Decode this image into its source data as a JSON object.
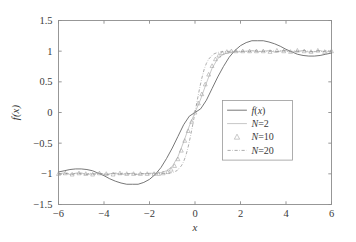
{
  "chart_data": {
    "type": "line",
    "title": "",
    "xlabel": "x",
    "ylabel": "f(x)",
    "xlim": [
      -6,
      6
    ],
    "ylim": [
      -1.5,
      1.5
    ],
    "xticks": [
      -6,
      -4,
      -2,
      0,
      2,
      4,
      6
    ],
    "xtick_labels": [
      "−6",
      "−4",
      "−2",
      "0",
      "2",
      "4",
      "6"
    ],
    "yticks": [
      -1.5,
      -1,
      -0.5,
      0,
      0.5,
      1,
      1.5
    ],
    "ytick_labels": [
      "−1.5",
      "−1",
      "−0.5",
      "0",
      "0.5",
      "1",
      "1.5"
    ],
    "grid": false,
    "legend_position": "center-right",
    "legend_entries": [
      {
        "label": "f(x)",
        "style": "solid",
        "marker": "none",
        "color": "#5e5e5e"
      },
      {
        "label": "N=2",
        "style": "solid-thin",
        "marker": "none",
        "color": "#b4b4b4"
      },
      {
        "label": "N=10",
        "style": "none",
        "marker": "triangle",
        "color": "#9c9c9c"
      },
      {
        "label": "N=20",
        "style": "dash-dot",
        "marker": "none",
        "color": "#8a8a8a"
      }
    ],
    "series": [
      {
        "name": "f(x)",
        "render": "line",
        "comment": "N=2 style smooth truncated series: large ripple, overshoot ~1.17 at x~2.5",
        "x": [
          -6.0,
          -5.75,
          -5.5,
          -5.25,
          -5.0,
          -4.75,
          -4.5,
          -4.25,
          -4.0,
          -3.75,
          -3.5,
          -3.25,
          -3.0,
          -2.75,
          -2.5,
          -2.25,
          -2.0,
          -1.75,
          -1.5,
          -1.25,
          -1.0,
          -0.75,
          -0.5,
          -0.25,
          0.0,
          0.25,
          0.5,
          0.75,
          1.0,
          1.25,
          1.5,
          1.75,
          2.0,
          2.25,
          2.5,
          2.75,
          3.0,
          3.25,
          3.5,
          3.75,
          4.0,
          4.25,
          4.5,
          4.75,
          5.0,
          5.25,
          5.5,
          5.75,
          6.0
        ],
        "y": [
          -0.97,
          -0.95,
          -0.93,
          -0.92,
          -0.92,
          -0.93,
          -0.95,
          -0.99,
          -1.03,
          -1.08,
          -1.12,
          -1.15,
          -1.17,
          -1.17,
          -1.17,
          -1.14,
          -1.09,
          -1.01,
          -0.9,
          -0.75,
          -0.58,
          -0.39,
          -0.2,
          -0.06,
          0.0,
          0.06,
          0.2,
          0.39,
          0.58,
          0.75,
          0.9,
          1.01,
          1.09,
          1.14,
          1.17,
          1.17,
          1.17,
          1.15,
          1.12,
          1.08,
          1.03,
          0.99,
          0.95,
          0.93,
          0.92,
          0.92,
          0.93,
          0.95,
          0.97
        ]
      },
      {
        "name": "N=2",
        "render": "line",
        "comment": "sharper transition, smaller amplitude ripple band near +-1",
        "x": [
          -6.0,
          -5.75,
          -5.5,
          -5.25,
          -5.0,
          -4.75,
          -4.5,
          -4.25,
          -4.0,
          -3.75,
          -3.5,
          -3.25,
          -3.0,
          -2.75,
          -2.5,
          -2.25,
          -2.0,
          -1.75,
          -1.5,
          -1.25,
          -1.0,
          -0.75,
          -0.5,
          -0.25,
          0.0,
          0.25,
          0.5,
          0.75,
          1.0,
          1.25,
          1.5,
          1.75,
          2.0,
          2.25,
          2.5,
          2.75,
          3.0,
          3.25,
          3.5,
          3.75,
          4.0,
          4.25,
          4.5,
          4.75,
          5.0,
          5.25,
          5.5,
          5.75,
          6.0
        ],
        "y": [
          -1.0,
          -0.985,
          -1.01,
          -0.99,
          -0.985,
          -1.01,
          -1.0,
          -0.985,
          -1.01,
          -1.0,
          -0.985,
          -1.01,
          -1.0,
          -0.99,
          -1.01,
          -1.0,
          -0.99,
          -0.99,
          -0.98,
          -0.95,
          -0.88,
          -0.72,
          -0.48,
          -0.22,
          0.0,
          0.22,
          0.48,
          0.72,
          0.88,
          0.95,
          0.98,
          0.99,
          0.99,
          1.0,
          1.01,
          0.99,
          1.0,
          1.01,
          0.985,
          1.0,
          1.01,
          0.985,
          1.0,
          1.01,
          0.985,
          0.99,
          1.01,
          0.985,
          1.0
        ]
      },
      {
        "name": "N=10",
        "render": "markers",
        "marker": "triangle",
        "comment": "triangle markers following the steep transition and the flat +-1 plateaus",
        "x": [
          -6.0,
          -5.7,
          -5.4,
          -5.1,
          -4.8,
          -4.5,
          -4.2,
          -3.9,
          -3.6,
          -3.3,
          -3.0,
          -2.7,
          -2.4,
          -2.1,
          -1.8,
          -1.6,
          -1.4,
          -1.2,
          -1.05,
          -0.9,
          -0.75,
          -0.6,
          -0.45,
          -0.3,
          -0.15,
          0.0,
          0.15,
          0.3,
          0.45,
          0.6,
          0.75,
          0.9,
          1.05,
          1.2,
          1.4,
          1.6,
          1.8,
          2.1,
          2.4,
          2.7,
          3.0,
          3.3,
          3.6,
          3.9,
          4.2,
          4.5,
          4.8,
          5.1,
          5.4,
          5.7,
          6.0
        ],
        "y": [
          -1.0,
          -0.99,
          -1.01,
          -0.99,
          -1.0,
          -1.01,
          -0.99,
          -1.0,
          -1.01,
          -0.99,
          -1.0,
          -1.0,
          -1.0,
          -1.0,
          -1.0,
          -1.0,
          -0.99,
          -0.97,
          -0.93,
          -0.87,
          -0.76,
          -0.62,
          -0.46,
          -0.3,
          -0.15,
          0.0,
          0.15,
          0.3,
          0.46,
          0.62,
          0.76,
          0.87,
          0.93,
          0.97,
          0.99,
          1.0,
          1.0,
          1.0,
          1.0,
          1.0,
          1.0,
          0.99,
          1.01,
          1.0,
          0.99,
          1.01,
          1.0,
          0.99,
          1.01,
          0.99,
          1.0
        ]
      },
      {
        "name": "N=20",
        "render": "line",
        "style": "dash-dot",
        "comment": "finest approximation, sharpest jump, tight ripple band around +-1",
        "x": [
          -6.0,
          -5.8,
          -5.6,
          -5.4,
          -5.2,
          -5.0,
          -4.8,
          -4.6,
          -4.4,
          -4.2,
          -4.0,
          -3.8,
          -3.6,
          -3.4,
          -3.2,
          -3.0,
          -2.8,
          -2.6,
          -2.4,
          -2.2,
          -2.0,
          -1.8,
          -1.6,
          -1.4,
          -1.2,
          -1.0,
          -0.8,
          -0.6,
          -0.5,
          -0.4,
          -0.3,
          -0.2,
          -0.1,
          0.0,
          0.1,
          0.2,
          0.3,
          0.4,
          0.5,
          0.6,
          0.8,
          1.0,
          1.2,
          1.4,
          1.6,
          1.8,
          2.0,
          2.2,
          2.4,
          2.6,
          2.8,
          3.0,
          3.2,
          3.4,
          3.6,
          3.8,
          4.0,
          4.2,
          4.4,
          4.6,
          4.8,
          5.0,
          5.2,
          5.4,
          5.6,
          5.8,
          6.0
        ],
        "y": [
          -1.0,
          -1.01,
          -0.99,
          -1.01,
          -0.99,
          -1.0,
          -1.01,
          -0.99,
          -1.01,
          -0.99,
          -1.0,
          -1.01,
          -0.99,
          -1.01,
          -0.99,
          -1.0,
          -1.0,
          -1.01,
          -0.99,
          -1.0,
          -1.0,
          -1.0,
          -1.0,
          -0.995,
          -0.99,
          -0.98,
          -0.95,
          -0.87,
          -0.8,
          -0.7,
          -0.56,
          -0.39,
          -0.2,
          0.0,
          0.2,
          0.39,
          0.56,
          0.7,
          0.8,
          0.87,
          0.95,
          0.98,
          0.99,
          0.995,
          1.0,
          1.0,
          1.0,
          1.0,
          0.99,
          1.01,
          1.0,
          1.0,
          0.99,
          1.01,
          0.99,
          1.01,
          1.0,
          0.99,
          1.01,
          0.99,
          1.01,
          1.0,
          0.99,
          1.01,
          0.99,
          1.01,
          1.0
        ]
      }
    ]
  }
}
